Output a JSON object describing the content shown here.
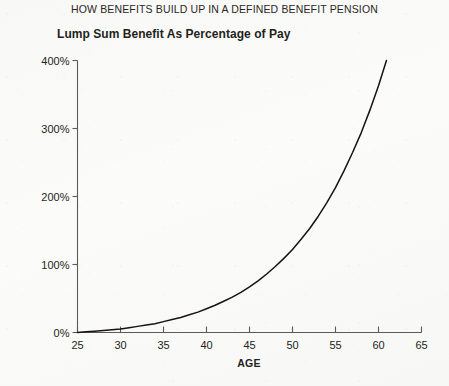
{
  "chart_data": {
    "type": "line",
    "title": "HOW BENEFITS BUILD UP IN A DEFINED BENEFIT PENSION",
    "subtitle": "Lump Sum Benefit As Percentage of Pay",
    "xlabel": "AGE",
    "ylabel": "",
    "xlim": [
      25,
      65
    ],
    "ylim": [
      0,
      400
    ],
    "grid": false,
    "legend": false,
    "xticks": [
      25,
      30,
      35,
      40,
      45,
      50,
      55,
      60,
      65
    ],
    "xtick_labels": [
      "25",
      "30",
      "35",
      "40",
      "45",
      "50",
      "55",
      "60",
      "65"
    ],
    "yticks": [
      0,
      100,
      200,
      300,
      400
    ],
    "ytick_labels": [
      "0%",
      "100%",
      "200%",
      "300%",
      "400%"
    ],
    "series": [
      {
        "name": "Lump Sum Benefit As Percentage of Pay",
        "color": "#17140f",
        "x": [
          25,
          26,
          27,
          28,
          29,
          30,
          31,
          32,
          33,
          34,
          35,
          36,
          37,
          38,
          39,
          40,
          41,
          42,
          43,
          44,
          45,
          46,
          47,
          48,
          49,
          50,
          51,
          52,
          53,
          54,
          55,
          56,
          57,
          58,
          59,
          60,
          61,
          62,
          63,
          64,
          65
        ],
        "values": [
          0,
          1,
          2,
          3,
          4,
          5,
          7,
          9,
          11,
          13,
          16,
          19,
          22,
          26,
          30,
          35,
          40,
          46,
          52,
          59,
          67,
          76,
          86,
          97,
          109,
          122,
          137,
          153,
          171,
          191,
          213,
          238,
          265,
          294,
          327,
          363,
          403,
          447,
          496,
          550,
          610
        ]
      }
    ],
    "annotations": []
  },
  "style": {
    "background": "#fbfbfa",
    "axis_color": "#5d5b58",
    "text_color": "#231f20",
    "curve_color": "#17140f"
  }
}
